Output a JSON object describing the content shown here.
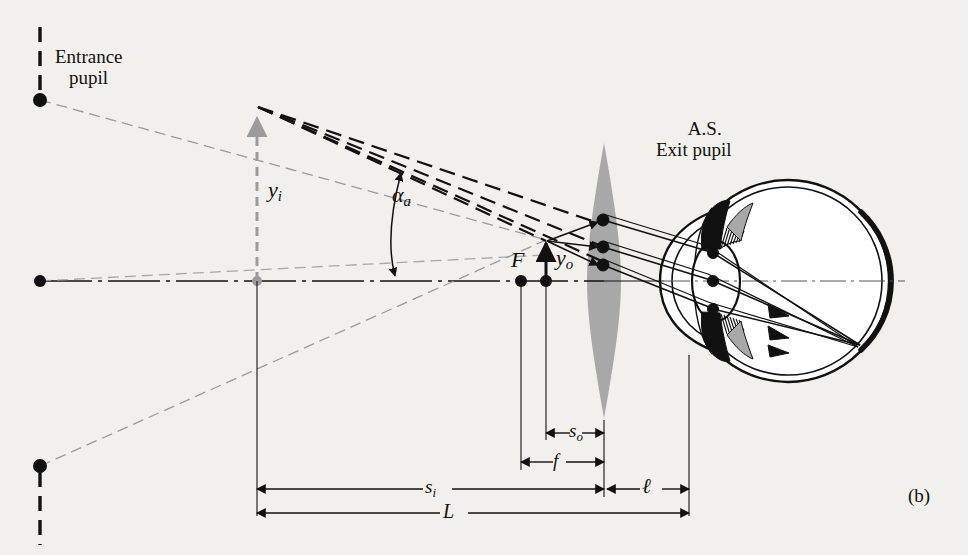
{
  "figure": {
    "panel_label": "(b)",
    "background_color": "#f2f0ec",
    "ink_color": "#111111",
    "ghost_color": "#9b9b9b",
    "lens_fill": "#a8a8a8"
  },
  "labels": {
    "entrance_pupil_line1": "Entrance",
    "entrance_pupil_line2": "pupil",
    "as_line1": "A.S.",
    "as_line2": "Exit pupil",
    "image_height": "y",
    "image_height_sub": "i",
    "object_height": "y",
    "object_height_sub": "o",
    "focal_point": "F",
    "angle": "α",
    "angle_sub": "a",
    "dim_so": "s",
    "dim_so_sub": "o",
    "dim_f": "f",
    "dim_si": "s",
    "dim_si_sub": "i",
    "dim_l_small": "ℓ",
    "dim_L_big": "L"
  },
  "geometry": {
    "axis_y": 281,
    "entrance_pupil_x": 40,
    "entrance_pupil_top_dot_y": 100,
    "entrance_pupil_bottom_dot_y": 466,
    "axis_left_dot_x": 40,
    "image_arrow_x": 257,
    "image_arrow_top_y": 106,
    "object_point_x": 546,
    "object_point_top_y": 240,
    "focal_point_x": 521,
    "lens_center_x": 604,
    "lens_top_y": 143,
    "lens_bottom_y": 418,
    "lens_half_width": 17,
    "eye_center_x": 788,
    "eye_radius": 101,
    "dim_so_y": 433,
    "dim_f_y": 462,
    "dim_si_y": 489,
    "dim_L_y": 512
  }
}
